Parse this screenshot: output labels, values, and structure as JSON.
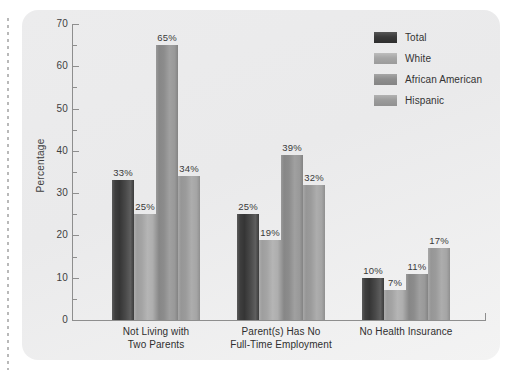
{
  "chart_data": {
    "type": "bar",
    "title": "",
    "xlabel": "",
    "ylabel": "Percentage",
    "ylim": [
      0,
      70
    ],
    "ytick_step": 10,
    "yminor_step": 5,
    "grid": false,
    "legend_position": "top-right",
    "categories": [
      "Not Living with\nTwo Parents",
      "Parent(s) Has No\nFull-Time Employment",
      "No Health Insurance"
    ],
    "category_lines": [
      [
        "Not Living with",
        "Two Parents"
      ],
      [
        "Parent(s) Has No",
        "Full-Time Employment"
      ],
      [
        "No Health Insurance"
      ]
    ],
    "ytick_labels": [
      "0",
      "10",
      "20",
      "30",
      "40",
      "50",
      "60",
      "70"
    ],
    "series": [
      {
        "name": "Total",
        "values": [
          33,
          25,
          10
        ],
        "labels": [
          "33%",
          "25%",
          "10%"
        ],
        "color": "#3a3a3a"
      },
      {
        "name": "White",
        "values": [
          25,
          19,
          7
        ],
        "labels": [
          "25%",
          "19%",
          "7%"
        ],
        "color": "#a6a6a6"
      },
      {
        "name": "African American",
        "values": [
          65,
          39,
          11
        ],
        "labels": [
          "65%",
          "39%",
          "11%"
        ],
        "color": "#8e8e8e"
      },
      {
        "name": "Hispanic",
        "values": [
          34,
          32,
          17
        ],
        "labels": [
          "34%",
          "32%",
          "17%"
        ],
        "color": "#9c9c9c"
      }
    ]
  },
  "legend": {
    "items": [
      {
        "label": "Total"
      },
      {
        "label": "White"
      },
      {
        "label": "African American"
      },
      {
        "label": "Hispanic"
      }
    ]
  },
  "axis": {
    "y_title": "Percentage"
  }
}
